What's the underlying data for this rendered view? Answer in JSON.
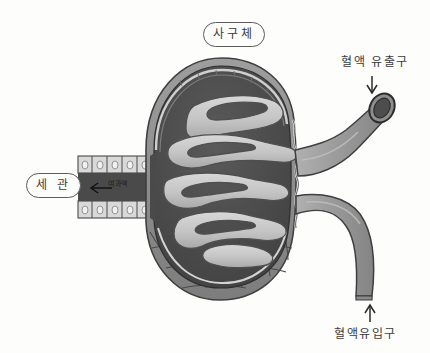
{
  "diagram": {
    "title_label": "사구체",
    "labels": {
      "glomerulus": "사구체",
      "tubule": "세 관",
      "blood_outflow": "혈액 유출구",
      "blood_inflow": "혈액유입구",
      "filtrate": "여과액"
    },
    "icons": {
      "outflow_arrow": "arrow-down-icon",
      "inflow_arrow": "arrow-up-icon",
      "filtrate_arrow": "arrow-left-icon"
    },
    "colors": {
      "background": "#fdfdfc",
      "ink": "#3a3a3a",
      "capsule_space_dark": "#4a4a4a",
      "capillary_light": "#c9c9c9",
      "capsule_wall": "#8e8e8e",
      "vessel_gray": "#9a9a9a",
      "vessel_lumen_dark": "#4d4d4d",
      "epithelium_cell": "#d8d8d8",
      "outer_capsule_cells": "#8a8a8a"
    }
  }
}
